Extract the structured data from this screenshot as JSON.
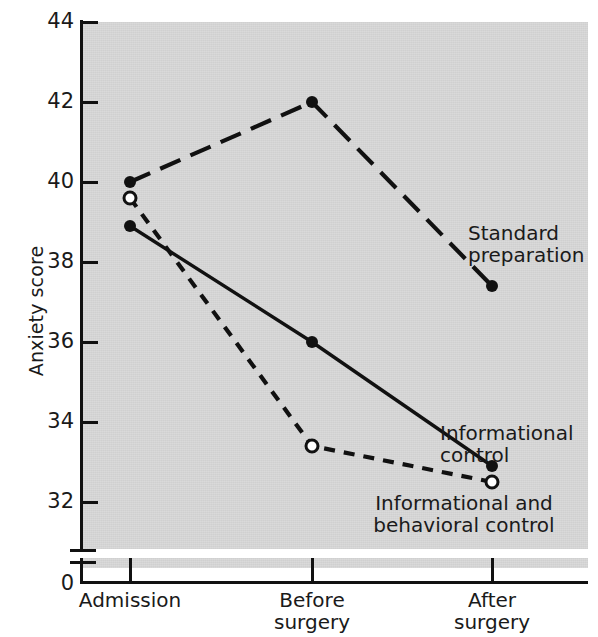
{
  "chart_data": {
    "type": "line",
    "title": "",
    "xlabel": "",
    "ylabel": "Anxiety score",
    "categories": [
      "Admission",
      "Before surgery",
      "After surgery"
    ],
    "category_lines": [
      [
        "Admission"
      ],
      [
        "Before",
        "surgery"
      ],
      [
        "After",
        "surgery"
      ]
    ],
    "ylim": [
      32,
      44
    ],
    "yticks": [
      32,
      34,
      36,
      38,
      40,
      42,
      44
    ],
    "ytick_labels": [
      "32",
      "34",
      "36",
      "38",
      "40",
      "42",
      "44"
    ],
    "axis_break": true,
    "origin_label": "0",
    "grid": false,
    "legend_position": "inline-annotations",
    "series": [
      {
        "name": "Standard preparation",
        "values": [
          40.0,
          42.0,
          37.4
        ],
        "line_style": "long-dash",
        "marker": "filled-circle",
        "color": "#111111"
      },
      {
        "name": "Informational control",
        "values": [
          38.9,
          36.0,
          32.9
        ],
        "line_style": "solid",
        "marker": "filled-circle",
        "color": "#111111"
      },
      {
        "name": "Informational and behavioral control",
        "values": [
          39.6,
          33.4,
          32.5
        ],
        "line_style": "short-dash",
        "marker": "open-circle",
        "color": "#111111"
      }
    ],
    "annotations": [
      {
        "text": "Standard\npreparation",
        "series": "Standard preparation"
      },
      {
        "text": "Informational\ncontrol",
        "series": "Informational control"
      },
      {
        "text": "Informational and\nbehavioral control",
        "series": "Informational and behavioral control"
      }
    ],
    "colors": {
      "plot_background": "#d7d7d7",
      "figure_background": "#ffffff",
      "ink": "#111111"
    }
  }
}
